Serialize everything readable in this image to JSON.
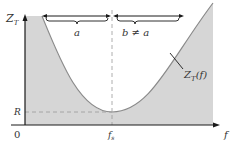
{
  "diagram": {
    "y_axis_label": "Z",
    "y_axis_label_sub": "T",
    "x_axis_label": "f",
    "origin_label": "0",
    "r_level_label": "R",
    "resonance_label": "f",
    "resonance_label_sub": "s",
    "left_span_label": "a",
    "right_span_label": "b ≠ a",
    "curve_label": "Z",
    "curve_label_sub": "T",
    "curve_label_suffix": "(f)",
    "colors": {
      "fill": "#d6d6d6",
      "curve": "#8a8a8a",
      "axis": "#1a1a1a",
      "dashed": "#9a9a9a",
      "text": "#333333"
    }
  }
}
